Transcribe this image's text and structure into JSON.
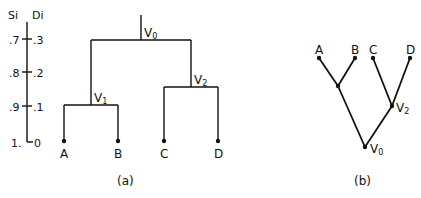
{
  "scale_axis": {
    "left_header": "Si",
    "right_header": "Di",
    "ticks": [
      {
        "si": ".7",
        "di": ".3",
        "y": 39
      },
      {
        "si": ".8",
        "di": ".2",
        "y": 72
      },
      {
        "si": ".9",
        "di": ".1",
        "y": 106
      },
      {
        "si": "1.",
        "di": "0",
        "y": 142
      }
    ]
  },
  "diagram_a": {
    "caption": "(a)",
    "root_label": "V",
    "root_sub": "0",
    "v1_label": "V",
    "v1_sub": "1",
    "v2_label": "V",
    "v2_sub": "2",
    "leaves": [
      "A",
      "B",
      "C",
      "D"
    ]
  },
  "diagram_b": {
    "caption": "(b)",
    "root_label": "V",
    "root_sub": "0",
    "v2_label": "V",
    "v2_sub": "2",
    "leaves": [
      "A",
      "B",
      "C",
      "D"
    ]
  }
}
